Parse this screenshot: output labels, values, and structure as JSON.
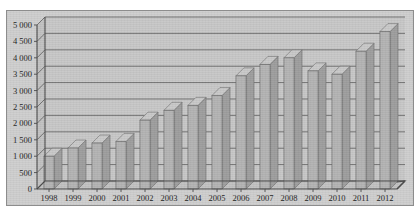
{
  "chart_data": {
    "type": "bar",
    "title": "",
    "subtitle": "",
    "xlabel": "",
    "ylabel": "",
    "categories": [
      "1998",
      "1999",
      "2000",
      "2001",
      "2002",
      "2003",
      "2004",
      "2005",
      "2006",
      "2007",
      "2008",
      "2009",
      "2010",
      "2011",
      "2012"
    ],
    "values": [
      1000,
      1250,
      1400,
      1450,
      2100,
      2400,
      2550,
      2850,
      3450,
      3800,
      4000,
      3600,
      3500,
      4200,
      4800
    ],
    "series": [
      {
        "name": "",
        "values": [
          1000,
          1250,
          1400,
          1450,
          2100,
          2400,
          2550,
          2850,
          3450,
          3800,
          4000,
          3600,
          3500,
          4200,
          4800
        ]
      }
    ],
    "ylim": [
      0,
      5000
    ],
    "ytick_values": [
      0,
      500,
      1000,
      1500,
      2000,
      2500,
      3000,
      3500,
      4000,
      4500,
      5000
    ],
    "ytick_labels": [
      "0",
      "500",
      "1 000",
      "1 500",
      "2 000",
      "2 500",
      "3 000",
      "3 500",
      "4 000",
      "4 500",
      "5 000"
    ],
    "grid": true,
    "grid_axis": "y",
    "legend": false,
    "legend_position": "none",
    "style": "3d-column",
    "annotations": []
  },
  "colors": {
    "plot_background": "#c8c8c8",
    "frame_border": "#8d8d8d",
    "bar_front": "#b4b4b4",
    "bar_top": "#c9c9c9",
    "bar_side": "#9e9e9e",
    "gridline": "#5c5c5c",
    "axis": "#4a4a4a",
    "text": "#1d1d1d",
    "page_background": "#ffffff"
  }
}
